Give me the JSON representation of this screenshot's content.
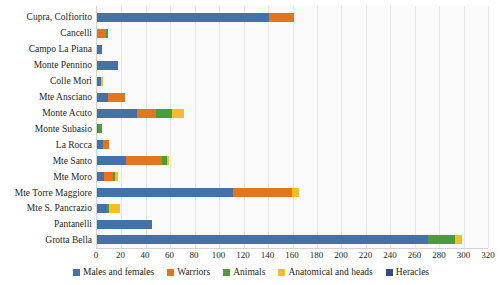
{
  "chart_data": {
    "type": "bar",
    "orientation": "horizontal",
    "stacked": true,
    "title": "",
    "xlabel": "",
    "ylabel": "",
    "xlim": [
      0,
      320
    ],
    "grid": true,
    "legend_position": "bottom",
    "xticks": [
      0,
      20,
      40,
      60,
      80,
      100,
      120,
      140,
      160,
      180,
      200,
      220,
      240,
      260,
      280,
      300,
      320
    ],
    "categories": [
      "Cupra, Colfiorito",
      "Cancelli",
      "Campo La Piana",
      "Monte Pennino",
      "Colle Mori",
      "Mte Ansciano",
      "Monte Acuto",
      "Monte Subasio",
      "La Rocca",
      "Mte Santo",
      "Mte Moro",
      "Mte Torre Maggiore",
      "Mte S. Pancrazio",
      "Pantanelli",
      "Grotta Bella"
    ],
    "series": [
      {
        "name": "Males and females",
        "color": "#4472a8",
        "values": [
          141,
          0,
          4,
          17,
          3,
          9,
          33,
          1,
          5,
          24,
          6,
          111,
          8,
          45,
          271
        ]
      },
      {
        "name": "Warriors",
        "color": "#e3761c",
        "values": [
          20,
          7,
          0,
          0,
          0,
          14,
          15,
          0,
          5,
          29,
          7,
          49,
          0,
          0,
          0
        ]
      },
      {
        "name": "Animals",
        "color": "#4b9c3a",
        "values": [
          0,
          2,
          0,
          0,
          0,
          0,
          13,
          3,
          0,
          4,
          2,
          0,
          2,
          0,
          22
        ]
      },
      {
        "name": "Anatomical and heads",
        "color": "#f4bf22",
        "values": [
          0,
          0,
          0,
          0,
          2,
          0,
          10,
          0,
          0,
          2,
          2,
          5,
          9,
          0,
          6
        ]
      },
      {
        "name": "Heracles",
        "color": "#2f4f80",
        "values": [
          0,
          0,
          0,
          0,
          0,
          0,
          0,
          0,
          0,
          0,
          0,
          0,
          0,
          0,
          0
        ]
      }
    ]
  },
  "legend": {
    "items": [
      {
        "label": "Males and females",
        "color": "#4472a8"
      },
      {
        "label": "Warriors",
        "color": "#e3761c"
      },
      {
        "label": "Animals",
        "color": "#4b9c3a"
      },
      {
        "label": "Anatomical and heads",
        "color": "#f4bf22"
      },
      {
        "label": "Heracles",
        "color": "#2f4f80"
      }
    ]
  }
}
